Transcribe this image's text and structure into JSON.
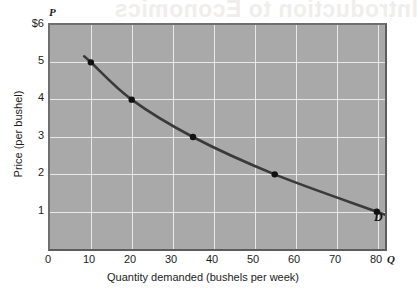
{
  "figure": {
    "background_text": "Introduction to Economics",
    "curve_label": "D",
    "p_axis_letter": "P",
    "q_axis_letter": "Q",
    "plot_fill_color": "#a9a9a9",
    "grid_color": "#e9e9e9",
    "curve_color": "#3a3a3a",
    "point_color": "#111111"
  },
  "chart_data": {
    "type": "line",
    "title": "",
    "xlabel": "Quantity demanded (bushels per week)",
    "ylabel": "Price (per bushel)",
    "xlim": [
      0,
      82
    ],
    "ylim": [
      0,
      6
    ],
    "grid": true,
    "legend": "D",
    "x_ticks": [
      "0",
      "10",
      "20",
      "30",
      "40",
      "50",
      "60",
      "70",
      "80"
    ],
    "x_tick_values": [
      0,
      10,
      20,
      30,
      40,
      50,
      60,
      70,
      80
    ],
    "y_ticks": [
      "$6",
      "5",
      "4",
      "3",
      "2",
      "1"
    ],
    "y_tick_values": [
      6,
      5,
      4,
      3,
      2,
      1
    ],
    "series": [
      {
        "name": "D",
        "x": [
          10,
          20,
          35,
          55,
          80
        ],
        "values": [
          5,
          4,
          3,
          2,
          1
        ],
        "points_labeled": false
      }
    ],
    "annotations": [
      {
        "text": "D",
        "x": 83,
        "y": 1.25
      },
      {
        "text": "P",
        "x": 0,
        "y": 6.4
      },
      {
        "text": "Q",
        "x": 84,
        "y": 0
      }
    ]
  }
}
